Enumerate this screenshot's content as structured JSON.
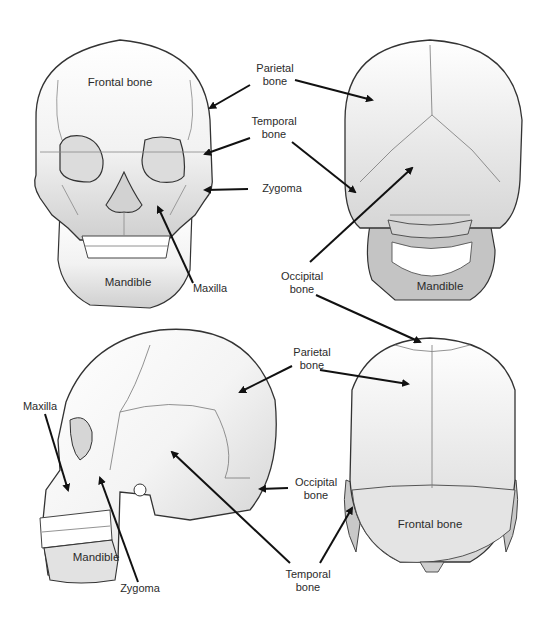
{
  "diagram": {
    "colors": {
      "bone_light": "#ffffff",
      "bone_shade": "#d8d8d8",
      "mandible_back": "#c4c4c4",
      "outline": "#333333",
      "suture": "#777777",
      "arrow": "#111111",
      "text": "#2b2b2b"
    },
    "views": [
      {
        "id": "anterior",
        "name": "Front view",
        "labels": {
          "frontal": "Frontal bone",
          "mandible": "Mandible",
          "maxilla": "Maxilla"
        }
      },
      {
        "id": "posterior",
        "name": "Back view",
        "labels": {
          "mandible": "Mandible"
        }
      },
      {
        "id": "lateral",
        "name": "Side view",
        "labels": {
          "maxilla": "Maxilla",
          "mandible": "Mandible",
          "zygoma": "Zygoma"
        }
      },
      {
        "id": "superior",
        "name": "Top view",
        "labels": {
          "frontal": "Frontal bone"
        }
      }
    ],
    "callouts": {
      "parietal_top": "Parietal\nbone",
      "temporal_top": "Temporal\nbone",
      "zygoma_top": "Zygoma",
      "occipital_mid": "Occipital\nbone",
      "parietal_bottom": "Parietal\nbone",
      "occipital_bottom": "Occipital\nbone",
      "temporal_bottom": "Temporal\nbone"
    }
  }
}
